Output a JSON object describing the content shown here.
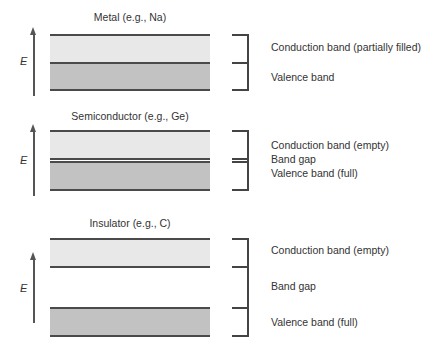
{
  "axis_label": "E",
  "panels": [
    {
      "title": "Metal (e.g., Na)",
      "labels": [
        "Conduction band (partially filled)",
        "Valence band"
      ]
    },
    {
      "title": "Semiconductor (e.g., Ge)",
      "labels": [
        "Conduction band (empty)",
        "Band gap",
        "Valence band (full)"
      ]
    },
    {
      "title": "Insulator (e.g., C)",
      "labels": [
        "Conduction band (empty)",
        "Band gap",
        "Valence band (full)"
      ]
    }
  ],
  "colors": {
    "conduction_band": "#e8e8e8",
    "valence_band": "#c2c2c2",
    "lines": "#4a4a4a"
  }
}
